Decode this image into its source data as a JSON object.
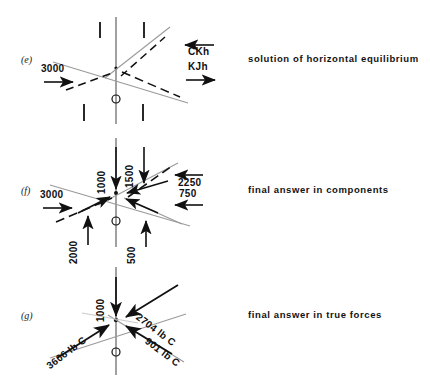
{
  "figure": {
    "panels": [
      {
        "letter": "(e)",
        "caption": "solution of horizontal equilibrium",
        "labels": {
          "left_force": "3000",
          "upper_right_force": "CKh",
          "lower_right_force": "KJh"
        }
      },
      {
        "letter": "(f)",
        "caption": "final answer in components",
        "labels": {
          "top_vertical": "1000",
          "top_right_vertical": "1500",
          "upper_right_horizontal": "2250",
          "lower_right_horizontal": "750",
          "left_horizontal": "3000",
          "lower_left_vertical": "2000",
          "lower_mid_vertical": "500"
        }
      },
      {
        "letter": "(g)",
        "caption": "final answer in true forces",
        "labels": {
          "top_vertical": "1000",
          "upper_right_member": "2704 lb C",
          "lower_left_member": "3606 lb C",
          "lower_right_member": "901 lb C"
        }
      }
    ]
  },
  "style": {
    "ink": "#111111",
    "member_gray": "#8d8d8d",
    "background": "#ffffff"
  }
}
